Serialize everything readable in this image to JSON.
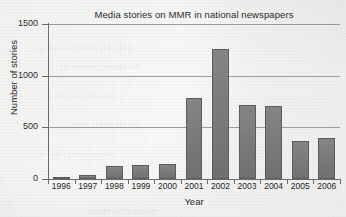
{
  "chart_data": {
    "type": "bar",
    "title": "Media stories on MMR in national newspapers",
    "xlabel": "Year",
    "ylabel": "Number of stories",
    "categories": [
      "1996",
      "1997",
      "1998",
      "1999",
      "2000",
      "2001",
      "2002",
      "2003",
      "2004",
      "2005",
      "2006"
    ],
    "values": [
      20,
      40,
      130,
      140,
      145,
      780,
      1260,
      715,
      710,
      370,
      395
    ],
    "ylim": [
      0,
      1500
    ],
    "yticks": [
      0,
      500,
      1000,
      1500
    ],
    "ytick_labels": [
      "0",
      "500",
      "1000",
      "1500"
    ],
    "grid": true,
    "legend": null,
    "colors": {
      "bar_fill": "#787878",
      "bar_edge": "#5d5d5d",
      "axis": "#6d6d6d",
      "gridline": "#9d9d9d",
      "text": "#2b2b2b",
      "background": "#ececeb"
    }
  },
  "ghost_text": [
    "the measles mumps and rubella",
    "vaccination coverage fell",
    "in the years following",
    "public confidence was",
    "national press reporting",
    "uptake of the vaccine"
  ]
}
